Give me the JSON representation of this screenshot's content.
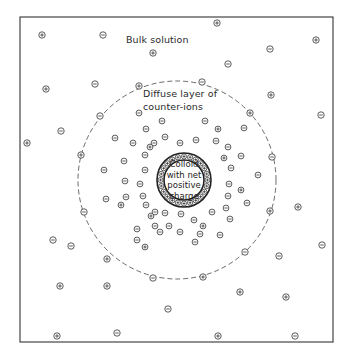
{
  "diagram": {
    "labels": {
      "bulk": "Bulk solution",
      "diffuse_line1": "Diffuse layer of",
      "diffuse_line2": "counter-ions",
      "colloid_line1": "Colloid",
      "colloid_line2": "with net",
      "colloid_line3": "positive",
      "colloid_line4": "charge"
    },
    "colors": {
      "stroke": "#333333",
      "background": "#ffffff"
    },
    "ion_symbols": {
      "positive": "⊕",
      "negative": "⊖"
    },
    "ions": [
      {
        "x": 42,
        "y": 35,
        "s": "+"
      },
      {
        "x": 103,
        "y": 35,
        "s": "-"
      },
      {
        "x": 217,
        "y": 23,
        "s": "+"
      },
      {
        "x": 153,
        "y": 53,
        "s": "+"
      },
      {
        "x": 316,
        "y": 40,
        "s": "+"
      },
      {
        "x": 270,
        "y": 49,
        "s": "-"
      },
      {
        "x": 228,
        "y": 64,
        "s": "-"
      },
      {
        "x": 46,
        "y": 89,
        "s": "+"
      },
      {
        "x": 95,
        "y": 84,
        "s": "-"
      },
      {
        "x": 271,
        "y": 95,
        "s": "+"
      },
      {
        "x": 321,
        "y": 115,
        "s": "-"
      },
      {
        "x": 27,
        "y": 143,
        "s": "+"
      },
      {
        "x": 61,
        "y": 131,
        "s": "-"
      },
      {
        "x": 53,
        "y": 240,
        "s": "-"
      },
      {
        "x": 71,
        "y": 246,
        "s": "-"
      },
      {
        "x": 60,
        "y": 286,
        "s": "+"
      },
      {
        "x": 107,
        "y": 286,
        "s": "+"
      },
      {
        "x": 57,
        "y": 336,
        "s": "+"
      },
      {
        "x": 117,
        "y": 333,
        "s": "-"
      },
      {
        "x": 168,
        "y": 309,
        "s": "-"
      },
      {
        "x": 298,
        "y": 207,
        "s": "+"
      },
      {
        "x": 322,
        "y": 245,
        "s": "-"
      },
      {
        "x": 279,
        "y": 256,
        "s": "-"
      },
      {
        "x": 240,
        "y": 292,
        "s": "+"
      },
      {
        "x": 286,
        "y": 297,
        "s": "+"
      },
      {
        "x": 218,
        "y": 336,
        "s": "+"
      },
      {
        "x": 295,
        "y": 336,
        "s": "-"
      }
    ],
    "boundary_ions": [
      {
        "x": 139,
        "y": 86,
        "s": "+"
      },
      {
        "x": 202,
        "y": 82,
        "s": "-"
      },
      {
        "x": 100,
        "y": 116,
        "s": "-"
      },
      {
        "x": 250,
        "y": 113,
        "s": "+"
      },
      {
        "x": 81,
        "y": 155,
        "s": "+"
      },
      {
        "x": 272,
        "y": 157,
        "s": "-"
      },
      {
        "x": 84,
        "y": 212,
        "s": "-"
      },
      {
        "x": 270,
        "y": 211,
        "s": "+"
      },
      {
        "x": 107,
        "y": 259,
        "s": "+"
      },
      {
        "x": 245,
        "y": 252,
        "s": "-"
      },
      {
        "x": 153,
        "y": 278,
        "s": "-"
      },
      {
        "x": 203,
        "y": 277,
        "s": "+"
      }
    ],
    "diffuse_ions": [
      {
        "x": 139,
        "y": 113,
        "s": "-"
      },
      {
        "x": 162,
        "y": 121,
        "s": "-"
      },
      {
        "x": 205,
        "y": 121,
        "s": "-"
      },
      {
        "x": 218,
        "y": 129,
        "s": "+"
      },
      {
        "x": 244,
        "y": 128,
        "s": "-"
      },
      {
        "x": 146,
        "y": 129,
        "s": "-"
      },
      {
        "x": 115,
        "y": 138,
        "s": "-"
      },
      {
        "x": 133,
        "y": 143,
        "s": "-"
      },
      {
        "x": 154,
        "y": 143,
        "s": "-"
      },
      {
        "x": 165,
        "y": 137,
        "s": "-"
      },
      {
        "x": 150,
        "y": 147,
        "s": "+"
      },
      {
        "x": 180,
        "y": 143,
        "s": "-"
      },
      {
        "x": 196,
        "y": 140,
        "s": "-"
      },
      {
        "x": 216,
        "y": 141,
        "s": "-"
      },
      {
        "x": 228,
        "y": 147,
        "s": "-"
      },
      {
        "x": 145,
        "y": 155,
        "s": "-"
      },
      {
        "x": 124,
        "y": 161,
        "s": "-"
      },
      {
        "x": 104,
        "y": 170,
        "s": "-"
      },
      {
        "x": 224,
        "y": 158,
        "s": "+"
      },
      {
        "x": 241,
        "y": 156,
        "s": "-"
      },
      {
        "x": 145,
        "y": 170,
        "s": "-"
      },
      {
        "x": 125,
        "y": 181,
        "s": "-"
      },
      {
        "x": 231,
        "y": 168,
        "s": "-"
      },
      {
        "x": 258,
        "y": 175,
        "s": "-"
      },
      {
        "x": 140,
        "y": 184,
        "s": "-"
      },
      {
        "x": 126,
        "y": 197,
        "s": "-"
      },
      {
        "x": 229,
        "y": 184,
        "s": "-"
      },
      {
        "x": 241,
        "y": 190,
        "s": "+"
      },
      {
        "x": 143,
        "y": 196,
        "s": "-"
      },
      {
        "x": 121,
        "y": 205,
        "s": "+"
      },
      {
        "x": 228,
        "y": 196,
        "s": "-"
      },
      {
        "x": 247,
        "y": 203,
        "s": "-"
      },
      {
        "x": 146,
        "y": 205,
        "s": "-"
      },
      {
        "x": 151,
        "y": 216,
        "s": "+"
      },
      {
        "x": 226,
        "y": 208,
        "s": "-"
      },
      {
        "x": 230,
        "y": 219,
        "s": "-"
      },
      {
        "x": 137,
        "y": 229,
        "s": "-"
      },
      {
        "x": 155,
        "y": 212,
        "s": "-"
      },
      {
        "x": 106,
        "y": 199,
        "s": "-"
      },
      {
        "x": 155,
        "y": 226,
        "s": "-"
      },
      {
        "x": 165,
        "y": 213,
        "s": "-"
      },
      {
        "x": 194,
        "y": 220,
        "s": "-"
      },
      {
        "x": 212,
        "y": 212,
        "s": "-"
      },
      {
        "x": 181,
        "y": 214,
        "s": "-"
      },
      {
        "x": 169,
        "y": 226,
        "s": "-"
      },
      {
        "x": 203,
        "y": 226,
        "s": "+"
      },
      {
        "x": 180,
        "y": 232,
        "s": "-"
      },
      {
        "x": 200,
        "y": 234,
        "s": "-"
      },
      {
        "x": 220,
        "y": 235,
        "s": "-"
      },
      {
        "x": 145,
        "y": 247,
        "s": "+"
      },
      {
        "x": 137,
        "y": 240,
        "s": "-"
      },
      {
        "x": 160,
        "y": 232,
        "s": "-"
      },
      {
        "x": 195,
        "y": 242,
        "s": "-"
      },
      {
        "x": 200,
        "y": 198,
        "s": "-"
      }
    ],
    "colloid": {
      "cx": 184,
      "cy": 180,
      "outer_r": 27,
      "inner_r": 20,
      "surface_charge_count": 24
    },
    "diffuse_boundary": {
      "cx": 177,
      "cy": 180,
      "r": 99
    },
    "frame": {
      "x": 20,
      "y": 17,
      "w": 313,
      "h": 325
    }
  }
}
